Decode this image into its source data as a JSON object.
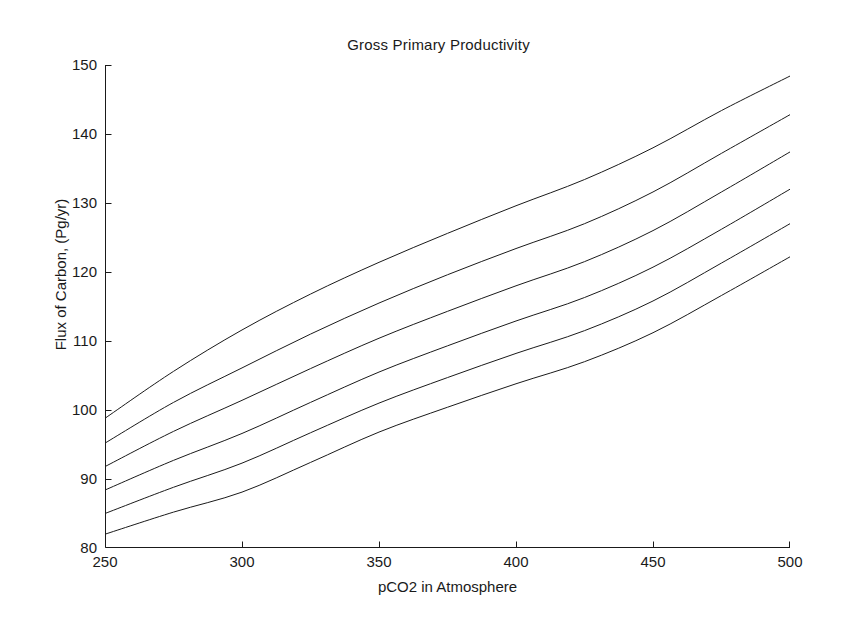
{
  "chart_data": {
    "type": "line",
    "title": "Gross Primary Productivity",
    "xlabel": "pCO2 in Atmosphere",
    "ylabel": "Flux of Carbon, (Pg/yr)",
    "xlim": [
      250,
      500
    ],
    "ylim": [
      80,
      150
    ],
    "xticks": [
      250,
      300,
      350,
      400,
      450,
      500
    ],
    "yticks": [
      80,
      90,
      100,
      110,
      120,
      130,
      140,
      150
    ],
    "grid": false,
    "legend": null,
    "line_color": "#1a1a1a",
    "background": "#ffffff",
    "x": [
      250,
      275,
      300,
      325,
      350,
      375,
      400,
      425,
      450,
      475,
      500
    ],
    "series": [
      {
        "name": "curve-1",
        "values": [
          98.8,
          105.6,
          111.6,
          116.8,
          121.4,
          125.6,
          129.6,
          133.4,
          138.0,
          143.4,
          148.4
        ]
      },
      {
        "name": "curve-2",
        "values": [
          95.2,
          101.1,
          106.1,
          111.0,
          115.5,
          119.6,
          123.4,
          127.0,
          131.6,
          137.2,
          142.8
        ]
      },
      {
        "name": "curve-3",
        "values": [
          91.8,
          96.9,
          101.4,
          106.0,
          110.4,
          114.3,
          118.0,
          121.5,
          126.0,
          131.6,
          137.4
        ]
      },
      {
        "name": "curve-4",
        "values": [
          88.4,
          92.7,
          96.6,
          101.1,
          105.5,
          109.3,
          112.9,
          116.3,
          120.7,
          126.2,
          132.0
        ]
      },
      {
        "name": "curve-5",
        "values": [
          85.0,
          88.8,
          92.3,
          96.7,
          101.0,
          104.7,
          108.2,
          111.5,
          115.8,
          121.3,
          127.0
        ]
      },
      {
        "name": "curve-6",
        "values": [
          82.0,
          85.2,
          88.1,
          92.4,
          96.8,
          100.4,
          103.8,
          107.0,
          111.2,
          116.6,
          122.2
        ]
      }
    ]
  }
}
